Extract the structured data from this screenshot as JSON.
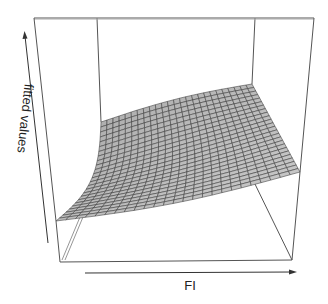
{
  "chart_data": {
    "type": "surface",
    "title": "",
    "xlabel": "FI",
    "ylabel": "",
    "zlabel": "fitted values",
    "ticks": "none",
    "grid_resolution": [
      25,
      25
    ],
    "surface_color": "#bdbdbd",
    "mesh_line_color": "#3a3a3a",
    "box": true,
    "projection": {
      "box_front_top_left": [
        34,
        18
      ],
      "box_front_top_right": [
        314,
        18
      ],
      "box_back_top_left": [
        97,
        18
      ],
      "box_back_top_right": [
        255,
        18
      ],
      "box_front_bottom_left": [
        60,
        262
      ],
      "box_front_bottom_right": [
        292,
        260
      ],
      "box_back_bottom_left": [
        80,
        217
      ],
      "box_back_bottom_right": [
        253,
        180
      ]
    },
    "surface_corners": {
      "front_left": [
        56,
        221
      ],
      "front_right": [
        300,
        172
      ],
      "back_left": [
        101,
        122
      ],
      "back_right": [
        252,
        84
      ]
    }
  },
  "axes": {
    "x_label": "FI",
    "z_label": "fitted values"
  }
}
